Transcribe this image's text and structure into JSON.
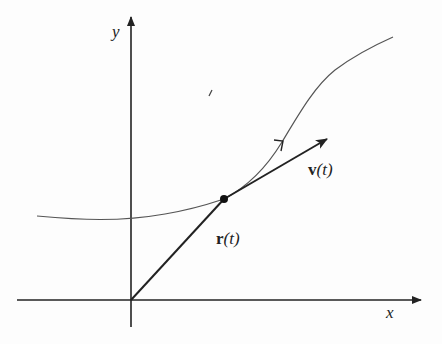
{
  "diagram": {
    "type": "vector-function-tangent",
    "axes": {
      "x_label": "x",
      "y_label": "y"
    },
    "labels": {
      "position_vector": {
        "symbol": "r",
        "arg": "(t)"
      },
      "velocity_vector": {
        "symbol": "v",
        "arg": "(t)"
      }
    },
    "colors": {
      "ink": "#222222",
      "curve": "#555555",
      "background": "#fdfdfd"
    }
  }
}
